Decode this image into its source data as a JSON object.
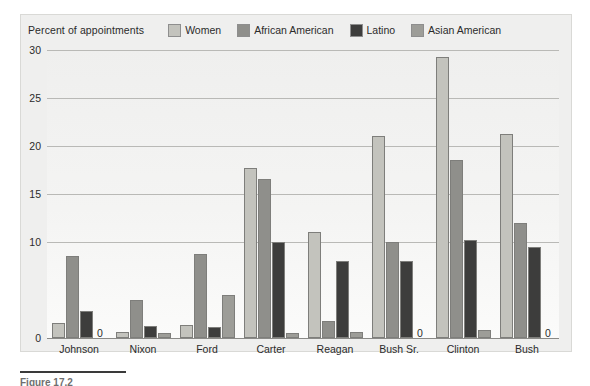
{
  "figure": {
    "caption": "Figure 17.2",
    "axis_caption": "Percent of appointments"
  },
  "chart_data": {
    "type": "bar",
    "title": "",
    "subtitle": "",
    "xlabel": "",
    "ylabel": "Percent of appointments",
    "ylim": [
      0,
      30
    ],
    "yticks": [
      30,
      25,
      20,
      15,
      10,
      0
    ],
    "grid": true,
    "legend_position": "top",
    "zero_marker": "0",
    "categories": [
      "Johnson",
      "Nixon",
      "Ford",
      "Carter",
      "Reagan",
      "Bush Sr.",
      "Clinton",
      "Bush"
    ],
    "series": [
      {
        "name": "Women",
        "color": "#c3c3bd",
        "values": [
          1.6,
          0.6,
          1.4,
          17.7,
          11.0,
          21.0,
          29.3,
          21.2
        ]
      },
      {
        "name": "African American",
        "color": "#8f8f8b",
        "values": [
          8.5,
          4.0,
          8.7,
          16.6,
          1.8,
          10.0,
          18.5,
          12.0
        ]
      },
      {
        "name": "Latino",
        "color": "#3d3d3c",
        "values": [
          2.8,
          1.2,
          1.1,
          10.0,
          8.0,
          8.0,
          10.2,
          9.5
        ]
      },
      {
        "name": "Asian American",
        "color": "#9d9d98",
        "values": [
          0,
          0.5,
          4.5,
          0.5,
          0.6,
          0,
          0.8,
          0
        ]
      }
    ]
  }
}
